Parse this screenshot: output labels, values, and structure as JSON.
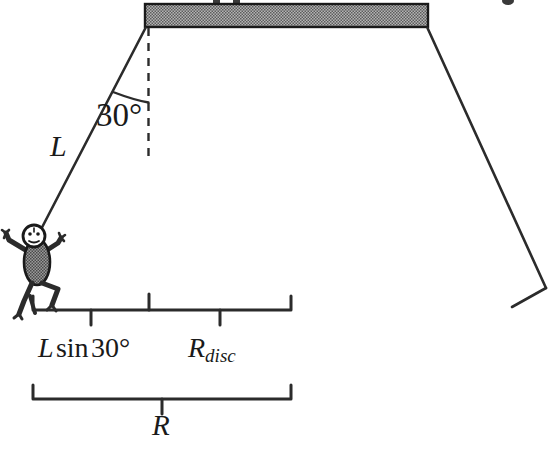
{
  "figure": {
    "type": "physics-free-body-diagram",
    "labels": {
      "angle": "30°",
      "rope_length": "L",
      "horizontal_offset": "L sin 30°",
      "horizontal_offset_parts": {
        "variable": "L",
        "function": "sin",
        "angle": "30°"
      },
      "disc_radius": "R",
      "disc_radius_subscript": "disc",
      "total_radius": "R"
    },
    "colors": {
      "line": "#2b2b2b",
      "bar_fill": "#8a8a8a",
      "bar_stroke": "#1a1a1a",
      "body_fill": "#7d7d7d",
      "background": "#ffffff"
    },
    "elements": {
      "overhead_bar": "hatched-gray-rectangle",
      "rope_left": "solid-line",
      "rope_right": "solid-line",
      "vertical_reference": "dashed-line",
      "angle_arc": "arc",
      "figure": "stick-figure-person",
      "brace_upper": "two-segment-brace",
      "brace_lower": "single-brace"
    }
  }
}
